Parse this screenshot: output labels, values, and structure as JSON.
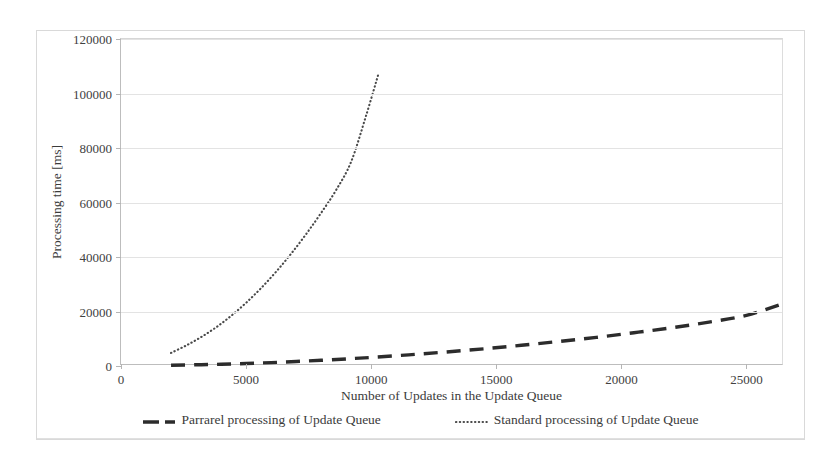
{
  "chart_data": {
    "type": "line",
    "title": "",
    "xlabel": "Number of Updates in the Update Queue",
    "ylabel": "Processing time [ms]",
    "xlim": [
      0,
      26500
    ],
    "ylim": [
      0,
      120000
    ],
    "xticks": [
      0,
      5000,
      10000,
      15000,
      20000,
      25000
    ],
    "xtick_labels": [
      "0",
      "5000",
      "10000",
      "15000",
      "20000",
      "25000"
    ],
    "yticks": [
      0,
      20000,
      40000,
      60000,
      80000,
      100000,
      120000
    ],
    "ytick_labels": [
      "0",
      "20000",
      "40000",
      "60000",
      "80000",
      "100000",
      "120000"
    ],
    "grid": "horizontal",
    "legend_position": "bottom",
    "series": [
      {
        "name": "Parrarel processing of Update Queue",
        "style": "dashed",
        "color": "#2c2c2c",
        "x": [
          2000,
          3000,
          4000,
          5000,
          6000,
          7000,
          8000,
          9000,
          10000,
          11500,
          13000,
          14500,
          16000,
          17500,
          19000,
          20500,
          22000,
          23500,
          25000,
          26400
        ],
        "y": [
          300,
          450,
          620,
          900,
          1250,
          1650,
          2100,
          2600,
          3150,
          4100,
          5150,
          6300,
          7600,
          9000,
          10500,
          12200,
          14000,
          16100,
          18600,
          22700
        ]
      },
      {
        "name": "Standard processing of Update Queue",
        "style": "dotted",
        "color": "#4a4a4a",
        "x": [
          2000,
          2600,
          3200,
          3800,
          4400,
          5000,
          5600,
          6200,
          6800,
          7400,
          8000,
          8600,
          9200,
          9800,
          10300
        ],
        "y": [
          4800,
          7500,
          10600,
          14200,
          18400,
          23200,
          28600,
          34600,
          41200,
          48400,
          56200,
          64600,
          75000,
          92000,
          107500
        ]
      }
    ]
  },
  "legend": {
    "items": [
      {
        "label": "Parrarel processing of Update Queue",
        "style": "dashed"
      },
      {
        "label": "Standard processing of Update Queue",
        "style": "dotted"
      }
    ]
  },
  "colors": {
    "series_parallel": "#2c2c2c",
    "series_standard": "#4a4a4a",
    "grid": "#e3e3e3",
    "axis": "#bdbdbd",
    "text": "#3b3b3b"
  }
}
